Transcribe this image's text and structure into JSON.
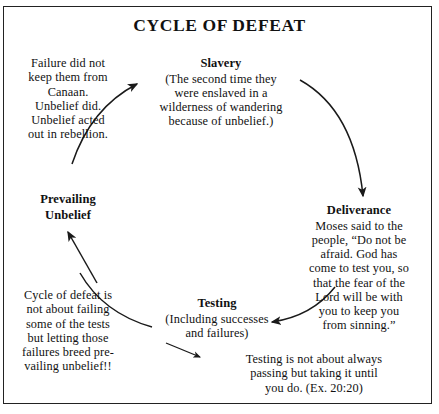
{
  "diagram": {
    "title": "CYCLE OF DEFEAT",
    "border_color": "#222222",
    "stroke_color": "#1a1a1a",
    "background": "#ffffff",
    "nodes": [
      {
        "id": "slavery",
        "title": "Slavery",
        "lines": [
          "(The second time they",
          "were enslaved in a",
          "wilderness of wandering",
          "because of unbelief.)"
        ]
      },
      {
        "id": "deliverance",
        "title": "Deliverance",
        "lines": [
          "Moses said to the",
          "people, “Do not be",
          "afraid. God has",
          "come to test you, so",
          "that the fear of the",
          "Lord will be with",
          "you to keep you",
          "from sinning.”"
        ]
      },
      {
        "id": "testing",
        "title": "Testing",
        "lines": [
          "(Including successes",
          "and failures)"
        ]
      },
      {
        "id": "prevailing-unbelief",
        "title_lines": [
          "Prevailing",
          "Unbelief"
        ]
      }
    ],
    "notes": [
      {
        "id": "failure-note",
        "lines": [
          "Failure did not",
          "keep them from",
          "Canaan.",
          "Unbelief did.",
          "Unbelief acted",
          "out in rebellion."
        ]
      },
      {
        "id": "cycle-note",
        "lines": [
          "Cycle of defeat is",
          "not about failing",
          "some of the tests",
          "but letting those",
          "failures breed pre-",
          "vailing unbelief!!"
        ]
      },
      {
        "id": "testing-note",
        "lines": [
          "Testing is not about always",
          "passing but taking it until",
          "you do. (Ex. 20:20)"
        ]
      }
    ],
    "arrows": [
      {
        "id": "arrow-to-slavery",
        "from": "prevailing-unbelief",
        "to": "slavery"
      },
      {
        "id": "arrow-to-deliverance",
        "from": "slavery",
        "to": "deliverance"
      },
      {
        "id": "arrow-to-testing",
        "from": "deliverance",
        "to": "testing"
      },
      {
        "id": "arrow-to-prevailing-unbelief",
        "from": "testing",
        "to": "prevailing-unbelief"
      },
      {
        "id": "pointer-cycle-note",
        "from": "cycle-note",
        "to": "prevailing-unbelief"
      },
      {
        "id": "pointer-testing-note",
        "from": "testing",
        "to": "testing-note"
      }
    ]
  }
}
